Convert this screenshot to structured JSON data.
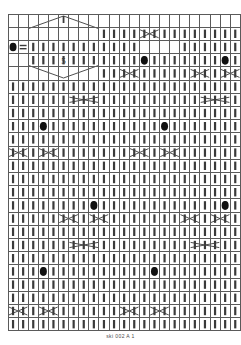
{
  "document": {
    "type": "knitting-stitch-chart",
    "caption": "ski 002 A 1"
  },
  "chart_data": {
    "type": "heatmap",
    "title": "",
    "subtitle": "",
    "xlabel": "",
    "ylabel": "",
    "grid": true,
    "legend_position": "none",
    "columns": 23,
    "rows": 24,
    "cell_width": 10.1,
    "cell_height": 13.2,
    "origin_x": 8,
    "origin_y": 14,
    "colors": {
      "grid_line": "#5a5a5a",
      "cell_fill": "#ffffff",
      "symbol_fill": "#3a3a3a",
      "dot_fill": "#111111",
      "background": "#ffffff",
      "caption_text": "#4a4a4a"
    },
    "symbol_legend": [
      {
        "name": "knit-stitch",
        "glyph": "vertical-bar",
        "description": "knit"
      },
      {
        "name": "purl-stitch",
        "glyph": "blank",
        "description": "purl / no stitch"
      },
      {
        "name": "bobble",
        "glyph": "filled-oval",
        "description": "bobble or nupp"
      },
      {
        "name": "equals-symbol",
        "glyph": "double-horizontal-bar",
        "description": "double horizontal bars"
      },
      {
        "name": "cable-cross",
        "glyph": "x-cross",
        "description": "2-stitch cable cross"
      },
      {
        "name": "wide-cable-cross",
        "glyph": "wide-x-cross",
        "description": "wide 3-stitch cable cross"
      },
      {
        "name": "chevron-up",
        "glyph": "inverted-v",
        "description": "upper half of lozenge motif"
      },
      {
        "name": "chevron-down",
        "glyph": "v-shape",
        "description": "lower half of lozenge motif"
      },
      {
        "name": "number-label",
        "glyph": "text",
        "description": "repeat count label"
      }
    ],
    "annotations": [
      {
        "text": "5",
        "col": 5,
        "row": 3,
        "name": "repeat-count-5"
      }
    ],
    "knit_cells": [
      {
        "row": 1,
        "cols": [
          9,
          10,
          11,
          12,
          13,
          14,
          15,
          16,
          17,
          18,
          19,
          20,
          21,
          22
        ]
      },
      {
        "row": 2,
        "cols": [
          2,
          3,
          4,
          5,
          6,
          7,
          8,
          9,
          10,
          11,
          12,
          17,
          18,
          19,
          20,
          21,
          22
        ]
      },
      {
        "row": 3,
        "cols": [
          2,
          3,
          4,
          5,
          6,
          7,
          8,
          9,
          10,
          11,
          12,
          13,
          14,
          15,
          16,
          17,
          18,
          19,
          20,
          21,
          22
        ]
      },
      {
        "row": 4,
        "cols": [
          9,
          10,
          11,
          12,
          13,
          14,
          15,
          16,
          17,
          18,
          19,
          20,
          21,
          22
        ]
      },
      {
        "row": 5,
        "cols": [
          0,
          1,
          2,
          3,
          4,
          5,
          6,
          7,
          8,
          9,
          10,
          11,
          12,
          13,
          14,
          15,
          16,
          17,
          18,
          19,
          20,
          21,
          22
        ]
      },
      {
        "row": 6,
        "cols": [
          0,
          1,
          2,
          3,
          4,
          5,
          6,
          7,
          8,
          9,
          10,
          11,
          12,
          13,
          14,
          15,
          16,
          17,
          18,
          19,
          20,
          21,
          22
        ]
      },
      {
        "row": 7,
        "cols": [
          0,
          1,
          2,
          3,
          4,
          5,
          6,
          7,
          8,
          9,
          10,
          11,
          12,
          13,
          14,
          15,
          16,
          17,
          18,
          19,
          20,
          21,
          22
        ]
      },
      {
        "row": 8,
        "cols": [
          0,
          1,
          2,
          3,
          4,
          5,
          6,
          7,
          8,
          9,
          10,
          11,
          12,
          13,
          14,
          15,
          16,
          17,
          18,
          19,
          20,
          21,
          22
        ]
      },
      {
        "row": 9,
        "cols": [
          0,
          1,
          2,
          3,
          4,
          5,
          6,
          7,
          8,
          9,
          10,
          11,
          12,
          13,
          14,
          15,
          16,
          17,
          18,
          19,
          20,
          21,
          22
        ]
      },
      {
        "row": 10,
        "cols": [
          0,
          1,
          2,
          3,
          4,
          5,
          6,
          7,
          8,
          9,
          10,
          11,
          12,
          13,
          14,
          15,
          16,
          17,
          18,
          19,
          20,
          21,
          22
        ]
      },
      {
        "row": 11,
        "cols": [
          0,
          1,
          2,
          3,
          4,
          5,
          6,
          7,
          8,
          9,
          10,
          11,
          12,
          13,
          14,
          15,
          16,
          17,
          18,
          19,
          20,
          21,
          22
        ]
      },
      {
        "row": 12,
        "cols": [
          0,
          1,
          2,
          3,
          4,
          5,
          6,
          7,
          8,
          9,
          10,
          11,
          12,
          13,
          14,
          15,
          16,
          17,
          18,
          19,
          20,
          21,
          22
        ]
      },
      {
        "row": 13,
        "cols": [
          0,
          1,
          2,
          3,
          4,
          5,
          6,
          7,
          8,
          9,
          10,
          11,
          12,
          13,
          14,
          15,
          16,
          17,
          18,
          19,
          20,
          21,
          22
        ]
      },
      {
        "row": 14,
        "cols": [
          0,
          1,
          2,
          3,
          4,
          5,
          6,
          7,
          8,
          9,
          10,
          11,
          12,
          13,
          14,
          15,
          16,
          17,
          18,
          19,
          20,
          21,
          22
        ]
      },
      {
        "row": 15,
        "cols": [
          0,
          1,
          2,
          3,
          4,
          5,
          6,
          7,
          8,
          9,
          10,
          11,
          12,
          13,
          14,
          15,
          16,
          17,
          18,
          19,
          20,
          21,
          22
        ]
      },
      {
        "row": 16,
        "cols": [
          0,
          1,
          2,
          3,
          4,
          5,
          6,
          7,
          8,
          9,
          10,
          11,
          12,
          13,
          14,
          15,
          16,
          17,
          18,
          19,
          20,
          21,
          22
        ]
      },
      {
        "row": 17,
        "cols": [
          0,
          1,
          2,
          3,
          4,
          5,
          6,
          7,
          8,
          9,
          10,
          11,
          12,
          13,
          14,
          15,
          16,
          17,
          18,
          19,
          20,
          21,
          22
        ]
      },
      {
        "row": 18,
        "cols": [
          0,
          1,
          2,
          3,
          4,
          5,
          6,
          7,
          8,
          9,
          10,
          11,
          12,
          13,
          14,
          15,
          16,
          17,
          18,
          19,
          20,
          21,
          22
        ]
      },
      {
        "row": 19,
        "cols": [
          0,
          1,
          2,
          3,
          4,
          5,
          6,
          7,
          8,
          9,
          10,
          11,
          12,
          13,
          14,
          15,
          16,
          17,
          18,
          19,
          20,
          21,
          22
        ]
      },
      {
        "row": 20,
        "cols": [
          0,
          1,
          2,
          3,
          4,
          5,
          6,
          7,
          8,
          9,
          10,
          11,
          12,
          13,
          14,
          15,
          16,
          17,
          18,
          19,
          20,
          21,
          22
        ]
      },
      {
        "row": 21,
        "cols": [
          0,
          1,
          2,
          3,
          4,
          5,
          6,
          7,
          8,
          9,
          10,
          11,
          12,
          13,
          14,
          15,
          16,
          17,
          18,
          19,
          20,
          21,
          22
        ]
      },
      {
        "row": 22,
        "cols": [
          0,
          1,
          2,
          3,
          4,
          5,
          6,
          7,
          8,
          9,
          10,
          11,
          12,
          13,
          14,
          15,
          16,
          17,
          18,
          19,
          20,
          21,
          22
        ]
      },
      {
        "row": 23,
        "cols": [
          0,
          1,
          2,
          3,
          4,
          5,
          6,
          7,
          8,
          9,
          10,
          11,
          12,
          13,
          14,
          15,
          16,
          17,
          18,
          19,
          20,
          21,
          22
        ]
      }
    ],
    "bobbles": [
      {
        "row": 2,
        "col": 0
      },
      {
        "row": 3,
        "col": 13
      },
      {
        "row": 3,
        "col": 21
      },
      {
        "row": 8,
        "col": 3
      },
      {
        "row": 8,
        "col": 15
      },
      {
        "row": 14,
        "col": 8
      },
      {
        "row": 14,
        "col": 21
      },
      {
        "row": 19,
        "col": 3
      },
      {
        "row": 19,
        "col": 14
      }
    ],
    "equals_marks": [
      {
        "row": 2,
        "col": 1
      }
    ],
    "cable_crosses": [
      {
        "row": 1,
        "col": 13,
        "span": 2,
        "kind": "narrow"
      },
      {
        "row": 4,
        "col": 11,
        "span": 2,
        "kind": "narrow"
      },
      {
        "row": 4,
        "col": 18,
        "span": 2,
        "kind": "narrow"
      },
      {
        "row": 4,
        "col": 21,
        "span": 2,
        "kind": "narrow"
      },
      {
        "row": 6,
        "col": 6,
        "span": 3,
        "kind": "wide"
      },
      {
        "row": 6,
        "col": 19,
        "span": 3,
        "kind": "wide"
      },
      {
        "row": 10,
        "col": 0,
        "span": 2,
        "kind": "narrow"
      },
      {
        "row": 10,
        "col": 3,
        "span": 2,
        "kind": "narrow"
      },
      {
        "row": 10,
        "col": 12,
        "span": 2,
        "kind": "narrow"
      },
      {
        "row": 10,
        "col": 15,
        "span": 2,
        "kind": "narrow"
      },
      {
        "row": 15,
        "col": 5,
        "span": 2,
        "kind": "narrow"
      },
      {
        "row": 15,
        "col": 8,
        "span": 2,
        "kind": "narrow"
      },
      {
        "row": 15,
        "col": 17,
        "span": 2,
        "kind": "narrow"
      },
      {
        "row": 15,
        "col": 20,
        "span": 2,
        "kind": "narrow"
      },
      {
        "row": 17,
        "col": 6,
        "span": 3,
        "kind": "wide"
      },
      {
        "row": 17,
        "col": 18,
        "span": 3,
        "kind": "wide"
      },
      {
        "row": 22,
        "col": 0,
        "span": 2,
        "kind": "narrow"
      },
      {
        "row": 22,
        "col": 3,
        "span": 2,
        "kind": "narrow"
      },
      {
        "row": 22,
        "col": 11,
        "span": 2,
        "kind": "narrow"
      },
      {
        "row": 22,
        "col": 14,
        "span": 2,
        "kind": "narrow"
      }
    ],
    "lozenge_motif": {
      "top_row": 0,
      "bottom_row": 4,
      "left_col": 2,
      "right_col": 8,
      "apex_col": 5,
      "name": "diamond-lozenge"
    }
  }
}
